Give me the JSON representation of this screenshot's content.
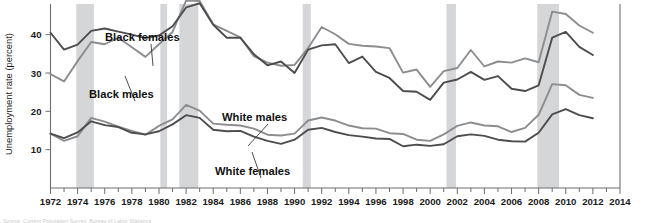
{
  "chart_data": {
    "type": "line",
    "title": "",
    "xlabel": "",
    "ylabel": "Unemployment rate (percent)",
    "xlim": [
      1972,
      2014
    ],
    "ylim": [
      0,
      48
    ],
    "yticks": [
      10,
      20,
      30,
      40
    ],
    "ytick_labels": [
      "10",
      "20",
      "30",
      "40"
    ],
    "grid": false,
    "legend_position": "inline-annotations",
    "x_major_step": 2,
    "x_minor_step": 1,
    "xtick_labels": [
      "1972",
      "1974",
      "1976",
      "1978",
      "1980",
      "1982",
      "1984",
      "1986",
      "1988",
      "1990",
      "1992",
      "1994",
      "1996",
      "1998",
      "2000",
      "2002",
      "2004",
      "2006",
      "2008",
      "2010",
      "2012",
      "2014"
    ],
    "x": [
      1972,
      1973,
      1974,
      1975,
      1976,
      1977,
      1978,
      1979,
      1980,
      1981,
      1982,
      1983,
      1984,
      1985,
      1986,
      1987,
      1988,
      1989,
      1990,
      1991,
      1992,
      1993,
      1994,
      1995,
      1996,
      1997,
      1998,
      1999,
      2000,
      2001,
      2002,
      2003,
      2004,
      2005,
      2006,
      2007,
      2008,
      2009,
      2010,
      2011,
      2012
    ],
    "series": [
      {
        "name": "Black females",
        "color": "#4d4d4f",
        "values": [
          40.5,
          36.1,
          37.4,
          41.0,
          41.6,
          40.8,
          40.0,
          39.1,
          39.8,
          42.2,
          47.1,
          48.2,
          42.6,
          39.2,
          39.2,
          34.9,
          32.0,
          33.0,
          30.0,
          36.1,
          37.2,
          37.5,
          32.6,
          34.3,
          30.3,
          28.7,
          25.3,
          25.1,
          23.0,
          27.5,
          28.3,
          30.3,
          28.2,
          29.2,
          25.9,
          25.3,
          26.8,
          39.2,
          40.7,
          36.8,
          34.7
        ]
      },
      {
        "name": "Black males",
        "color": "#8c8d8f",
        "values": [
          29.7,
          27.8,
          33.1,
          38.1,
          37.5,
          39.2,
          36.7,
          34.2,
          37.5,
          40.7,
          48.9,
          48.8,
          42.7,
          41.0,
          39.3,
          34.4,
          32.7,
          31.9,
          32.1,
          36.5,
          42.0,
          40.1,
          37.6,
          37.1,
          36.9,
          36.5,
          30.1,
          30.9,
          26.4,
          30.5,
          31.3,
          36.0,
          31.7,
          33.0,
          32.7,
          33.8,
          32.8,
          46.0,
          45.4,
          42.4,
          40.5
        ]
      },
      {
        "name": "White males",
        "color": "#8c8d8f",
        "values": [
          14.2,
          12.3,
          13.5,
          18.3,
          17.3,
          16.0,
          14.9,
          13.9,
          16.2,
          17.9,
          21.7,
          20.2,
          16.8,
          16.5,
          16.3,
          15.5,
          13.9,
          13.7,
          14.2,
          17.6,
          18.4,
          17.6,
          16.3,
          15.6,
          15.5,
          14.3,
          14.1,
          12.6,
          12.3,
          14.0,
          16.2,
          17.1,
          16.3,
          16.1,
          14.6,
          15.7,
          19.1,
          27.1,
          26.8,
          24.3,
          23.5
        ]
      },
      {
        "name": "White females",
        "color": "#4d4d4f",
        "values": [
          14.2,
          13.0,
          14.5,
          17.4,
          16.4,
          15.9,
          14.4,
          14.0,
          14.8,
          16.6,
          19.0,
          18.3,
          15.2,
          14.8,
          14.9,
          13.4,
          12.3,
          11.5,
          12.6,
          15.2,
          15.7,
          14.6,
          13.8,
          13.4,
          12.9,
          12.8,
          10.9,
          11.3,
          11.0,
          11.4,
          13.5,
          14.0,
          13.6,
          12.6,
          12.2,
          12.1,
          14.4,
          19.2,
          20.6,
          19.0,
          18.2
        ]
      }
    ],
    "recession_bands": [
      {
        "start": 1973.9,
        "end": 1975.2
      },
      {
        "start": 1980.1,
        "end": 1980.6
      },
      {
        "start": 1981.5,
        "end": 1982.9
      },
      {
        "start": 1990.6,
        "end": 1991.2
      },
      {
        "start": 2001.2,
        "end": 2001.9
      },
      {
        "start": 2007.9,
        "end": 2009.5
      }
    ],
    "annotations": [
      {
        "text": "Black females",
        "x": 105,
        "y": 41,
        "leader_to_x": 153,
        "leader_to_y": 66
      },
      {
        "text": "Black males",
        "x": 89,
        "y": 98,
        "leader_to_x": 125,
        "leader_to_y": 76
      },
      {
        "text": "White males",
        "x": 222,
        "y": 121,
        "leader_to_x": 248,
        "leader_to_y": 146
      },
      {
        "text": "White females",
        "x": 215,
        "y": 175,
        "leader_to_x": 252,
        "leader_to_y": 152
      }
    ]
  },
  "footer": {
    "source_note": "Source: Current Population Survey, Bureau of Labor Statistics"
  }
}
